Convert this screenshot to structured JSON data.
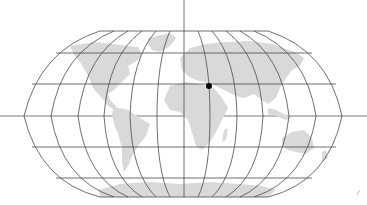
{
  "map": {
    "projection": "robinson-like",
    "graticule": {
      "parallel_y": [
        31,
        53,
        84,
        116,
        147,
        178,
        197
      ],
      "equator_y": 116,
      "meridian_x_at_equator": [
        24,
        51,
        78,
        104,
        130,
        157,
        184,
        210,
        237,
        263,
        289,
        316,
        342
      ],
      "line_color": "#4a4a4a"
    },
    "land_color": "#d9d9d9",
    "axes": {
      "vertical_x": 184,
      "horizontal_y": 116,
      "color": "#6a6a6a"
    },
    "marker": {
      "name": "location-marker",
      "x": 209,
      "y": 86,
      "color": "#000000"
    },
    "continents": [
      "North America",
      "South America",
      "Europe",
      "Asia",
      "Africa",
      "Australia",
      "Antarctica",
      "Greenland"
    ]
  },
  "corner_mark": "/"
}
